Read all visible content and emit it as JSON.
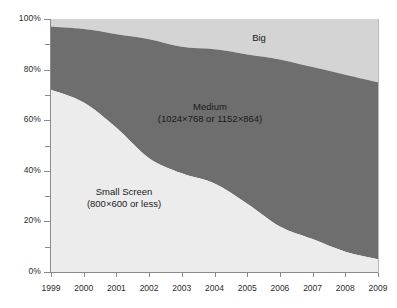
{
  "chart_data": {
    "type": "area",
    "stacked": true,
    "normalized_percent": true,
    "title": "",
    "subtitle": "",
    "xlabel": "",
    "ylabel": "",
    "x": [
      1999,
      2000,
      2001,
      2002,
      2003,
      2004,
      2005,
      2006,
      2007,
      2008,
      2009
    ],
    "categories": [
      "1999",
      "2000",
      "2001",
      "2002",
      "2003",
      "2004",
      "2005",
      "2006",
      "2007",
      "2008",
      "2009"
    ],
    "xlim": [
      1999,
      2009
    ],
    "ylim": [
      0,
      100
    ],
    "y_major_ticks": [
      0,
      20,
      40,
      60,
      80,
      100
    ],
    "y_major_tick_labels": [
      "0%",
      "20%",
      "40%",
      "60%",
      "80%",
      "100%"
    ],
    "y_minor_ticks": [
      10,
      30,
      50,
      70,
      90
    ],
    "grid": false,
    "legend": "in-plot area labels",
    "series": [
      {
        "name": "Small Screen",
        "label_line1": "Small Screen",
        "label_line2": "(800×600 or less)",
        "color": "#ececec",
        "values": [
          72,
          67,
          57,
          45,
          39,
          35,
          27,
          18,
          13,
          8,
          5
        ]
      },
      {
        "name": "Medium",
        "label_line1": "Medium",
        "label_line2": "(1024×768 or 1152×864)",
        "color": "#6e6e6e",
        "values": [
          25,
          29,
          37,
          47,
          50,
          53,
          59,
          66,
          68,
          70,
          70
        ]
      },
      {
        "name": "Big",
        "label_line1": "Big",
        "label_line2": "",
        "color": "#d4d4d4",
        "values": [
          3,
          4,
          6,
          8,
          11,
          12,
          14,
          16,
          19,
          22,
          25
        ]
      }
    ],
    "cumulative_top_boundaries": {
      "small_screen_top": [
        72,
        67,
        57,
        45,
        39,
        35,
        27,
        18,
        13,
        8,
        5
      ],
      "medium_top": [
        97,
        96,
        94,
        92,
        89,
        88,
        86,
        84,
        81,
        78,
        75
      ]
    },
    "colors": {
      "small_screen": "#ececec",
      "medium": "#6e6e6e",
      "big": "#d4d4d4",
      "axis": "#8a8a8a",
      "text": "#2b2b2b",
      "background": "#ffffff"
    }
  }
}
